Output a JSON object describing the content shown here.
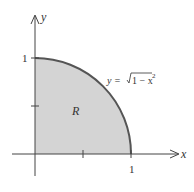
{
  "diagram": {
    "type": "region-under-curve",
    "region_label": "R",
    "curve_label": {
      "lhs": "y = ",
      "radical": "1 − x",
      "exponent": "2"
    },
    "axes": {
      "x_label": "x",
      "y_label": "y",
      "x_tick_label": "1",
      "y_tick_label": "1"
    },
    "colors": {
      "fill": "#d4d4d4",
      "curve": "#555555",
      "axis": "#444444",
      "background": "#ffffff"
    }
  }
}
